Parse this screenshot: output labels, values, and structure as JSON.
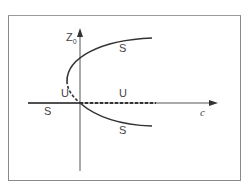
{
  "diagram": {
    "type": "bifurcation-diagram",
    "axes": {
      "x_label": "c",
      "y_label": "Z",
      "y_label_subscript": "0"
    },
    "branch_labels": [
      {
        "id": "upper-branch",
        "text": "S",
        "stability": "stable"
      },
      {
        "id": "lower-branch",
        "text": "S",
        "stability": "stable"
      },
      {
        "id": "trivial-left",
        "text": "S",
        "stability": "stable"
      },
      {
        "id": "trivial-right",
        "text": "U",
        "stability": "unstable"
      },
      {
        "id": "turning-branch",
        "text": "U",
        "stability": "unstable"
      }
    ],
    "colors": {
      "line": "#333333",
      "frame": "#8a8a8a",
      "text": "#444444"
    }
  }
}
